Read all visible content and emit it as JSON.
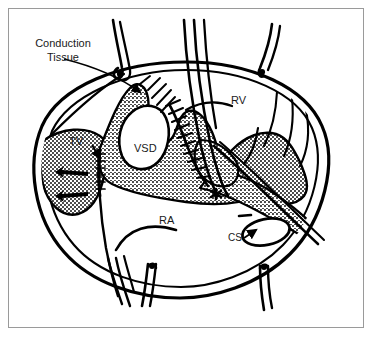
{
  "figure": {
    "background_color": "#ffffff",
    "ink_color": "#000000",
    "border_color": "#9a9a9a",
    "labels": {
      "conduction_tissue": "Conduction\nTissue",
      "conduction_tissue_line1": "Conduction",
      "conduction_tissue_line2": "Tissue",
      "tricuspid_valve": "TV",
      "ventricular_septal_defect": "VSD",
      "right_ventricle": "RV",
      "right_atrium": "RA",
      "coronary_sinus": "CS"
    },
    "markers": {
      "asterisk": "✳",
      "asterisk_note": "asterisk marker on atrial septum"
    },
    "annotations": [
      {
        "name": "conduction-tissue-leader",
        "target": "conduction tissue region at superior VSD rim"
      },
      {
        "name": "tv-arrow",
        "target": "tricuspid valve leaflet"
      },
      {
        "name": "cs-arrow",
        "target": "coronary sinus ostium"
      },
      {
        "name": "flow-arrow-upper",
        "target": "tricuspid leaflet retraction"
      },
      {
        "name": "flow-arrow-lower",
        "target": "tricuspid leaflet retraction"
      }
    ],
    "elements": {
      "suture_count_top": 3,
      "suture_count_bottom": 2,
      "stipple_texture": "dotted",
      "patch_suture_texture": "hatched stitches"
    }
  }
}
